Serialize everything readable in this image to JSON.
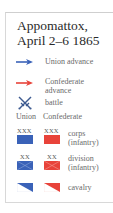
{
  "title": {
    "line1": "Appomattox,",
    "line2": "April 2–6 1865"
  },
  "colors": {
    "union": "#3a62b8",
    "confederate": "#e8433a",
    "frame": "#d8d8d8",
    "text": "#6a6a6a",
    "title": "#2a2a2a"
  },
  "legend": {
    "union_advance": {
      "icon": "blue-arrow-icon",
      "label": "Union advance"
    },
    "confederate_advance": {
      "icon": "red-arrow-icon",
      "label_line1": "Confederate",
      "label_line2": "advance"
    },
    "battle": {
      "icon": "crossed-swords-icon",
      "label": "battle"
    },
    "columns": {
      "union": "Union",
      "confederate": "Confederate"
    },
    "corps": {
      "symbol": "XXX",
      "label_line1": "corps",
      "label_line2": "(infantry)"
    },
    "division": {
      "symbol": "XX",
      "label_line1": "division",
      "label_line2": "(infantry)"
    },
    "cavalry": {
      "label": "cavalry"
    }
  }
}
